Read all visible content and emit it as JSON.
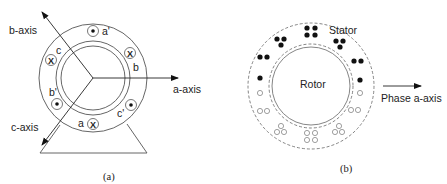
{
  "figure_a": {
    "caption": "(a)",
    "axes": {
      "a": "a-axis",
      "b": "b-axis",
      "c": "c-axis"
    },
    "conductors": [
      {
        "label": "a'",
        "symbol": "dot"
      },
      {
        "label": "b",
        "symbol": "cross"
      },
      {
        "label": "c'",
        "symbol": "dot"
      },
      {
        "label": "a",
        "symbol": "cross"
      },
      {
        "label": "b'",
        "symbol": "dot"
      },
      {
        "label": "c",
        "symbol": "cross"
      }
    ],
    "symbols": {
      "cross": "X"
    }
  },
  "figure_b": {
    "caption": "(b)",
    "stator_label": "Stator",
    "rotor_label": "Rotor",
    "axis_label": "Phase a-axis"
  }
}
